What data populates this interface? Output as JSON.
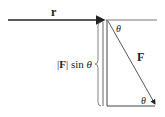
{
  "diagram": {
    "labels": {
      "r": "r",
      "theta_top": "θ",
      "F": "F",
      "perp_bar_open": "|",
      "perp_F": "F",
      "perp_bar_close": "|",
      "perp_sin": " sin ",
      "perp_theta": "θ",
      "theta_bottom": "θ"
    },
    "colors": {
      "line": "#222222",
      "thin_line": "#555555",
      "background": "#ffffff"
    }
  }
}
